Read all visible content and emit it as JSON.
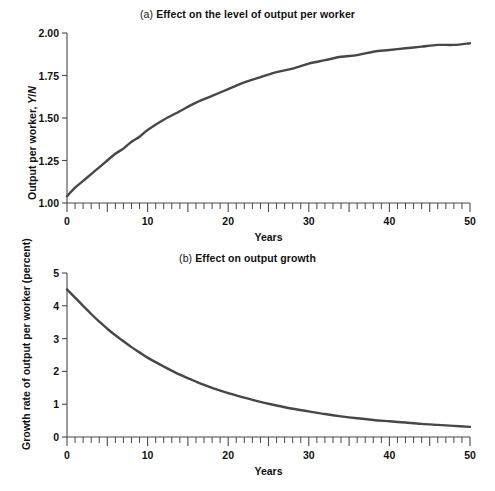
{
  "figure": {
    "background": "#ffffff",
    "curve_color": "#474747",
    "axis_color": "#4a4a4a",
    "curve_width": 2.4
  },
  "panels": [
    {
      "id": "a",
      "tag": "(a)",
      "title": "Effect on the level of output per worker",
      "y_axis_label_prefix": "Output per worker, ",
      "y_axis_label_italic_y": "Y",
      "y_axis_label_slash": "/",
      "y_axis_label_italic_n": "N",
      "x_axis_label": "Years",
      "y_ticks": [
        "1.00",
        "1.25",
        "1.50",
        "1.75",
        "2.00"
      ],
      "x_ticks": [
        "0",
        "10",
        "20",
        "30",
        "40",
        "50"
      ]
    },
    {
      "id": "b",
      "tag": "(b)",
      "title": "Effect on output growth",
      "y_axis_label": "Growth rate of output per worker (percent)",
      "x_axis_label": "Years",
      "y_ticks": [
        "0",
        "1",
        "2",
        "3",
        "4",
        "5"
      ],
      "x_ticks": [
        "0",
        "10",
        "20",
        "30",
        "40",
        "50"
      ]
    }
  ],
  "chart_data": [
    {
      "type": "line",
      "panel": "a",
      "title": "(a) Effect on the level of output per worker",
      "xlabel": "Years",
      "ylabel": "Output per worker, Y/N",
      "xlim": [
        0,
        50
      ],
      "ylim": [
        1.0,
        2.0
      ],
      "grid": false,
      "legend": "none",
      "x_major_ticks": [
        0,
        10,
        20,
        30,
        40,
        50
      ],
      "x_minor_tick_step": 1,
      "y_major_ticks": [
        1.0,
        1.25,
        1.5,
        1.75,
        2.0
      ],
      "series": [
        {
          "name": "Output per worker",
          "x": [
            0,
            1,
            2,
            3,
            4,
            5,
            6,
            7,
            8,
            9,
            10,
            12,
            14,
            16,
            18,
            20,
            22,
            24,
            26,
            28,
            30,
            32,
            34,
            36,
            38,
            40,
            42,
            44,
            46,
            48,
            50
          ],
          "values": [
            1.04,
            1.09,
            1.13,
            1.17,
            1.21,
            1.25,
            1.29,
            1.32,
            1.36,
            1.39,
            1.43,
            1.49,
            1.54,
            1.59,
            1.63,
            1.67,
            1.71,
            1.74,
            1.77,
            1.79,
            1.82,
            1.84,
            1.86,
            1.87,
            1.89,
            1.9,
            1.91,
            1.92,
            1.93,
            1.93,
            1.94
          ]
        }
      ]
    },
    {
      "type": "line",
      "panel": "b",
      "title": "(b) Effect on output growth",
      "xlabel": "Years",
      "ylabel": "Growth rate of output per worker (percent)",
      "xlim": [
        0,
        50
      ],
      "ylim": [
        0,
        5
      ],
      "grid": false,
      "legend": "none",
      "x_major_ticks": [
        0,
        10,
        20,
        30,
        40,
        50
      ],
      "x_minor_tick_step": 1,
      "y_major_ticks": [
        0,
        1,
        2,
        3,
        4,
        5
      ],
      "series": [
        {
          "name": "Growth rate of output per worker",
          "x": [
            0,
            1,
            2,
            3,
            4,
            5,
            6,
            7,
            8,
            9,
            10,
            12,
            14,
            16,
            18,
            20,
            22,
            24,
            26,
            28,
            30,
            32,
            34,
            36,
            38,
            40,
            42,
            44,
            46,
            48,
            50
          ],
          "values": [
            4.5,
            4.25,
            4.0,
            3.75,
            3.52,
            3.3,
            3.1,
            2.92,
            2.74,
            2.58,
            2.42,
            2.15,
            1.9,
            1.69,
            1.5,
            1.34,
            1.2,
            1.07,
            0.96,
            0.86,
            0.78,
            0.7,
            0.63,
            0.57,
            0.52,
            0.48,
            0.44,
            0.4,
            0.37,
            0.34,
            0.31
          ]
        }
      ]
    }
  ]
}
